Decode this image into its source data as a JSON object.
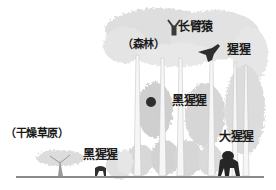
{
  "diagram": {
    "type": "habitat-illustration",
    "habitats": [
      {
        "id": "savanna",
        "label": "（干燥草原）"
      },
      {
        "id": "forest",
        "label": "（森林）"
      }
    ],
    "species": [
      {
        "id": "gibbon",
        "label": "长臂猿",
        "habitat": "forest",
        "position": "canopy top"
      },
      {
        "id": "orangutan",
        "label": "猩猩",
        "habitat": "forest",
        "position": "canopy"
      },
      {
        "id": "chimpanzee-forest",
        "label": "黑猩猩",
        "habitat": "forest",
        "position": "mid trees"
      },
      {
        "id": "gorilla",
        "label": "大猩猩",
        "habitat": "forest",
        "position": "ground"
      },
      {
        "id": "chimpanzee-savanna",
        "label": "黑猩猩",
        "habitat": "savanna",
        "position": "ground"
      }
    ],
    "colors": {
      "foliage": "#d9d9d9",
      "trunk": "#f2f2f2",
      "ground": "#8a8a8a",
      "animal": "#2b2b2b"
    }
  }
}
